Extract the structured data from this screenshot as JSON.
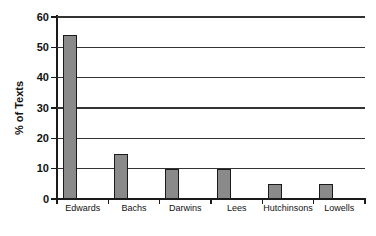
{
  "figure": {
    "background": "#ffffff"
  },
  "chart_data": {
    "type": "bar",
    "categories": [
      "Edwards",
      "Bachs",
      "Darwins",
      "Lees",
      "Hutchinsons",
      "Lowells"
    ],
    "values": [
      54,
      15,
      10,
      10,
      5,
      5
    ],
    "title": "",
    "xlabel": "",
    "ylabel": "% of Texts",
    "ylim": [
      0,
      60
    ],
    "yticks": [
      0,
      10,
      20,
      30,
      40,
      50,
      60
    ],
    "grid": true,
    "legend": false,
    "bar_fill_color": "#8a8a8a",
    "bar_border_color": "#1a1a1a",
    "axis_color": "#1a1a1a",
    "gridline_color": "#333333",
    "text_color": "#111111"
  }
}
